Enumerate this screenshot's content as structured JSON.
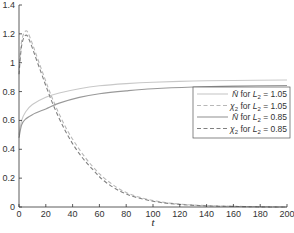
{
  "chart_data": {
    "type": "line",
    "title": "",
    "xlabel": "t",
    "ylabel": "",
    "xlim": [
      0,
      200
    ],
    "ylim": [
      0,
      1.4
    ],
    "grid": false,
    "legend_position": "right-center",
    "xticks": [
      0,
      20,
      40,
      60,
      80,
      100,
      120,
      140,
      160,
      180,
      200
    ],
    "yticks": [
      0,
      0.2,
      0.4,
      0.6,
      0.8,
      1,
      1.2,
      1.4
    ],
    "xtick_labels": [
      "0",
      "20",
      "40",
      "60",
      "80",
      "100",
      "120",
      "140",
      "160",
      "180",
      "200"
    ],
    "ytick_labels": [
      "0",
      "0.2",
      "0.4",
      "0.6",
      "0.8",
      "1",
      "1.2",
      "1.4"
    ],
    "series": [
      {
        "name": "N̄ for L2 = 1.05",
        "legend_label": "N̄ for L₂ = 1.05",
        "style": "solid",
        "color": "#c8c8c8",
        "x": [
          0,
          2,
          5,
          10,
          20,
          30,
          45,
          60,
          80,
          100,
          130,
          160,
          200
        ],
        "values": [
          0.5,
          0.6,
          0.66,
          0.71,
          0.76,
          0.79,
          0.82,
          0.84,
          0.855,
          0.865,
          0.873,
          0.877,
          0.88
        ]
      },
      {
        "name": "χ2 for L2 = 1.05",
        "legend_label": "χ₂ for L₂ = 1.05",
        "style": "dashed",
        "color": "#b8b8b8",
        "x": [
          0,
          2,
          5,
          8,
          15,
          25,
          35,
          45,
          55,
          65,
          80,
          100,
          120,
          140,
          160,
          180,
          200
        ],
        "values": [
          0.95,
          1.15,
          1.22,
          1.18,
          1.0,
          0.75,
          0.55,
          0.4,
          0.28,
          0.19,
          0.1,
          0.045,
          0.02,
          0.01,
          0.005,
          0.002,
          0.0
        ]
      },
      {
        "name": "N̄ for L2 = 0.85",
        "legend_label": "N̄ for L₂ = 0.85",
        "style": "solid",
        "color": "#999999",
        "x": [
          0,
          2,
          5,
          10,
          20,
          30,
          45,
          60,
          80,
          100,
          130,
          160,
          200
        ],
        "values": [
          0.48,
          0.57,
          0.61,
          0.64,
          0.68,
          0.72,
          0.76,
          0.785,
          0.805,
          0.82,
          0.832,
          0.838,
          0.842
        ]
      },
      {
        "name": "χ2 for L2 = 0.85",
        "legend_label": "χ₂ for L₂ = 0.85",
        "style": "dashed",
        "color": "#808080",
        "x": [
          0,
          2,
          5,
          8,
          15,
          25,
          35,
          45,
          55,
          65,
          80,
          100,
          120,
          140,
          160,
          180,
          200
        ],
        "values": [
          0.92,
          1.12,
          1.19,
          1.15,
          0.97,
          0.72,
          0.52,
          0.37,
          0.26,
          0.17,
          0.09,
          0.04,
          0.018,
          0.008,
          0.004,
          0.001,
          0.0
        ]
      }
    ]
  },
  "plot": {
    "x_axis_label": "t",
    "legend": {
      "items": [
        {
          "prefix": "N̄",
          "suffix": " for ",
          "var": "L",
          "sub": "2",
          "value": " = 1.05"
        },
        {
          "prefix": "χ",
          "prefix_sub": "2",
          "suffix": " for ",
          "var": "L",
          "sub": "2",
          "value": " = 1.05"
        },
        {
          "prefix": "N̄",
          "suffix": " for ",
          "var": "L",
          "sub": "2",
          "value": " = 0.85"
        },
        {
          "prefix": "χ",
          "prefix_sub": "2",
          "suffix": " for ",
          "var": "L",
          "sub": "2",
          "value": " = 0.85"
        }
      ]
    },
    "colors": {
      "axis": "#333333",
      "legend_border": "#555555",
      "background": "#ffffff"
    }
  }
}
